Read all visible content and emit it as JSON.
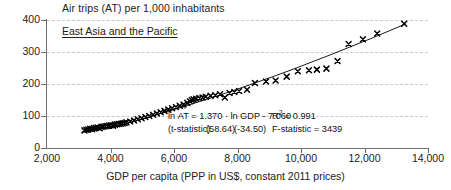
{
  "chart_data": {
    "type": "scatter",
    "title": "Air trips (AT) per 1,000 inhabitants",
    "series_label": "East Asia and the Pacific",
    "xlabel": "GDP per capita (PPP in US$, constant 2011 prices)",
    "ylabel": "Air trips (AT) per 1,000 inhabitants",
    "xlim": [
      2000,
      14000
    ],
    "ylim": [
      0,
      400
    ],
    "xticks": [
      "2,000",
      "4,000",
      "6,000",
      "8,000",
      "10,000",
      "12,000",
      "14,000"
    ],
    "xtick_values": [
      2000,
      4000,
      6000,
      8000,
      10000,
      12000,
      14000
    ],
    "yticks": [
      "0",
      "100",
      "200",
      "300",
      "400"
    ],
    "ytick_values": [
      0,
      100,
      200,
      300,
      400
    ],
    "grid": "horizontal-dashed",
    "legend": "none",
    "marker": "x",
    "marker_color": "#000000",
    "fit_line_color": "#000000",
    "fit": {
      "form": "ln AT = 1.370 * ln GDP - 7.060",
      "slope": 1.37,
      "intercept": -7.06,
      "r_squared": 0.991,
      "f_statistic": 3439,
      "t_statistic_slope": 58.64,
      "t_statistic_intercept": -34.5
    },
    "points": [
      [
        3180,
        55
      ],
      [
        3240,
        57
      ],
      [
        3300,
        58
      ],
      [
        3360,
        60
      ],
      [
        3420,
        59
      ],
      [
        3480,
        62
      ],
      [
        3540,
        63
      ],
      [
        3600,
        64
      ],
      [
        3660,
        62
      ],
      [
        3720,
        66
      ],
      [
        3780,
        67
      ],
      [
        3840,
        68
      ],
      [
        3900,
        69
      ],
      [
        3960,
        70
      ],
      [
        4020,
        71
      ],
      [
        4080,
        70
      ],
      [
        4140,
        73
      ],
      [
        4200,
        74
      ],
      [
        4260,
        75
      ],
      [
        4320,
        76
      ],
      [
        4380,
        77
      ],
      [
        4440,
        78
      ],
      [
        4500,
        80
      ],
      [
        4620,
        83
      ],
      [
        4740,
        86
      ],
      [
        4860,
        90
      ],
      [
        4980,
        93
      ],
      [
        5100,
        97
      ],
      [
        5220,
        100
      ],
      [
        5340,
        104
      ],
      [
        5460,
        108
      ],
      [
        5580,
        112
      ],
      [
        5700,
        116
      ],
      [
        5820,
        120
      ],
      [
        5940,
        124
      ],
      [
        6060,
        128
      ],
      [
        6180,
        132
      ],
      [
        6300,
        136
      ],
      [
        6420,
        141
      ],
      [
        6500,
        146
      ],
      [
        6560,
        150
      ],
      [
        6620,
        152
      ],
      [
        6700,
        154
      ],
      [
        6800,
        156
      ],
      [
        6900,
        158
      ],
      [
        7000,
        160
      ],
      [
        7150,
        163
      ],
      [
        7300,
        165
      ],
      [
        7450,
        168
      ],
      [
        7600,
        158
      ],
      [
        7750,
        172
      ],
      [
        7900,
        175
      ],
      [
        8050,
        178
      ],
      [
        8300,
        182
      ],
      [
        8550,
        203
      ],
      [
        8900,
        208
      ],
      [
        9200,
        211
      ],
      [
        9550,
        223
      ],
      [
        9900,
        240
      ],
      [
        10250,
        243
      ],
      [
        10500,
        245
      ],
      [
        10800,
        248
      ],
      [
        11150,
        272
      ],
      [
        11500,
        325
      ],
      [
        11950,
        340
      ],
      [
        12400,
        358
      ],
      [
        13250,
        388
      ]
    ],
    "fit_curve_points": [
      [
        4450,
        76
      ],
      [
        5000,
        91
      ],
      [
        5600,
        108
      ],
      [
        6200,
        126
      ],
      [
        6800,
        145
      ],
      [
        7400,
        164
      ],
      [
        8000,
        184
      ],
      [
        8600,
        205
      ],
      [
        9200,
        226
      ],
      [
        9800,
        248
      ],
      [
        10400,
        271
      ],
      [
        11000,
        294
      ],
      [
        11600,
        318
      ],
      [
        12200,
        342
      ],
      [
        12800,
        367
      ],
      [
        13300,
        388
      ]
    ]
  },
  "annotation": {
    "eq_lhs_prefix": "ln ",
    "eq_lhs_base": "AT",
    "eq_hat": "˄",
    "eq_rhs": " = 1.370 · ln GDP - 7.060",
    "r_squared_label": "R",
    "r_squared_sup": "2",
    "r_squared_value": " = 0.991",
    "t_stat_label": "(t-statistic)",
    "t_stat_slope": "(58.64)",
    "t_stat_intercept": "(-34.50)",
    "f_stat": "F-statistic = 3439"
  }
}
